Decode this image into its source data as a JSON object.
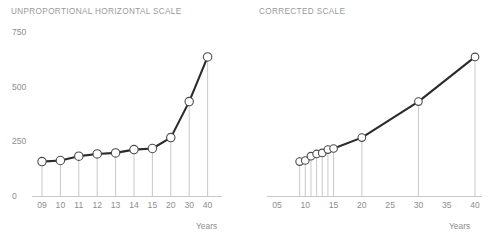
{
  "charts": {
    "left": {
      "title": "UNPROPORTIONAL HORIZONTAL SCALE",
      "axis_caption": "Years"
    },
    "right": {
      "title": "CORRECTED SCALE",
      "axis_caption": "Years"
    }
  },
  "colors": {
    "line": "#2b2b2b",
    "marker_fill": "#ffffff",
    "marker_stroke": "#4a4a4a",
    "drop_line": "#c9c9c9",
    "axis": "#c9c9c9",
    "text": "#8e8e8e",
    "title": "#9a9a9a",
    "background": "#ffffff"
  },
  "chart_data": [
    {
      "type": "line",
      "id": "unproportional-horizontal-scale",
      "title": "UNPROPORTIONAL HORIZONTAL SCALE",
      "xlabel": "Years",
      "ylabel": "",
      "categories": [
        "09",
        "10",
        "11",
        "12",
        "13",
        "14",
        "15",
        "20",
        "30",
        "40"
      ],
      "x": [
        9,
        10,
        11,
        12,
        13,
        14,
        15,
        20,
        30,
        40
      ],
      "values": [
        160,
        165,
        185,
        195,
        200,
        215,
        220,
        270,
        435,
        640
      ],
      "ytick_labels": [
        "750",
        "500",
        "250",
        "0"
      ],
      "ytick_values": [
        750,
        500,
        250,
        0
      ],
      "xtick_labels": [
        "09",
        "10",
        "11",
        "12",
        "13",
        "14",
        "15",
        "20",
        "30",
        "40"
      ],
      "ylim": [
        0,
        800
      ],
      "grid": false,
      "legend": "none",
      "note": "Horizontal axis spaces all categories evenly regardless of the unequal year gaps."
    },
    {
      "type": "line",
      "id": "corrected-scale",
      "title": "CORRECTED SCALE",
      "xlabel": "Years",
      "ylabel": "",
      "categories": [
        "09",
        "10",
        "11",
        "12",
        "13",
        "14",
        "15",
        "20",
        "30",
        "40"
      ],
      "x": [
        9,
        10,
        11,
        12,
        13,
        14,
        15,
        20,
        30,
        40
      ],
      "values": [
        160,
        165,
        185,
        195,
        200,
        215,
        220,
        270,
        435,
        640
      ],
      "ytick_labels": [],
      "ytick_values": [],
      "xtick_labels": [
        "05",
        "10",
        "15",
        "20",
        "25",
        "30",
        "35",
        "40"
      ],
      "xtick_values": [
        5,
        10,
        15,
        20,
        25,
        30,
        35,
        40
      ],
      "xlim": [
        5,
        40
      ],
      "ylim": [
        0,
        800
      ],
      "grid": false,
      "legend": "none",
      "note": "Horizontal axis is linear in years, so the early points bunch together."
    }
  ]
}
